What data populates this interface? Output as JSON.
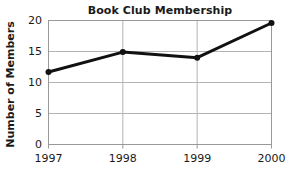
{
  "chart_data": {
    "type": "line",
    "title": "Book Club Membership",
    "xlabel": "",
    "ylabel": "Number of Members",
    "categories": [
      "1997",
      "1998",
      "1999",
      "2000"
    ],
    "values": [
      11.7,
      14.9,
      14.0,
      19.6
    ],
    "series": [
      {
        "name": "Members",
        "values": [
          11.7,
          14.9,
          14.0,
          19.6
        ]
      }
    ],
    "ylim": [
      0,
      20
    ],
    "yticks": [
      0,
      5,
      10,
      15,
      20
    ],
    "ytick_labels": [
      "0",
      "5",
      "10",
      "15",
      "20"
    ],
    "xtick_labels": [
      "1997",
      "1998",
      "1999",
      "2000"
    ],
    "grid": true,
    "legend": "none",
    "line_color": "#111111",
    "grid_color": "#b3b3b3",
    "axis_color": "#999999",
    "background": "#ffffff",
    "marker": "circle"
  }
}
